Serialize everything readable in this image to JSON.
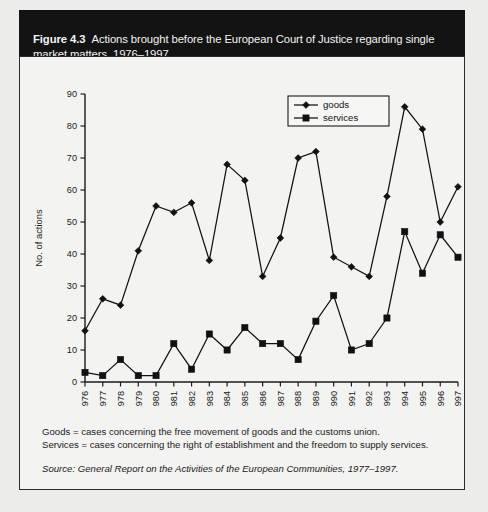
{
  "figure": {
    "number_label": "Figure 4.3",
    "caption": "Actions brought before the European Court of Justice regarding single market matters, 1976–1997"
  },
  "notes": {
    "goods_note": "Goods = cases concerning the free movement of goods and the customs union.",
    "services_note": "Services = cases concerning the right of establishment and the freedom to supply services.",
    "source_label": "Source:",
    "source_title": "General Report on the Activities of the European Communities",
    "source_years": ", 1977–1997."
  },
  "chart_data": {
    "type": "line",
    "title": "Actions brought before the European Court of Justice regarding single market matters, 1976–1997",
    "xlabel": "",
    "ylabel": "No. of actions",
    "ylim": [
      0,
      90
    ],
    "ytick_step": 10,
    "yticks": [
      "0",
      "10",
      "20",
      "30",
      "40",
      "50",
      "60",
      "70",
      "80",
      "90"
    ],
    "grid": false,
    "legend_position": "top-center-right",
    "categories": [
      "1976",
      "1977",
      "1978",
      "1979",
      "1980",
      "1981",
      "1982",
      "1983",
      "1984",
      "1985",
      "1986",
      "1987",
      "1988",
      "1989",
      "1990",
      "1991",
      "1992",
      "1993",
      "1994",
      "1995",
      "1996",
      "1997"
    ],
    "series": [
      {
        "name": "goods",
        "marker": "diamond",
        "color": "#111111",
        "values": [
          16,
          26,
          24,
          41,
          55,
          53,
          56,
          38,
          68,
          63,
          33,
          45,
          70,
          72,
          39,
          36,
          33,
          58,
          86,
          79,
          50,
          61
        ]
      },
      {
        "name": "services",
        "marker": "square",
        "color": "#111111",
        "values": [
          3,
          2,
          7,
          2,
          2,
          12,
          4,
          15,
          10,
          17,
          12,
          12,
          7,
          19,
          27,
          10,
          12,
          20,
          47,
          34,
          46,
          39
        ]
      }
    ]
  }
}
